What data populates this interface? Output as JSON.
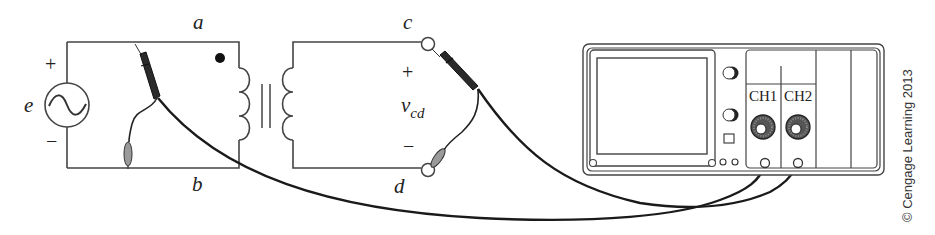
{
  "diagram": {
    "source": {
      "label": "e",
      "plus": "+",
      "minus": "−",
      "symbol": "ac-sine"
    },
    "primary": {
      "top_label": "a",
      "bottom_label": "b",
      "dot_marker": true
    },
    "secondary": {
      "top_terminal": "c",
      "bottom_terminal": "d",
      "voltage_label": "v",
      "voltage_subscript": "cd",
      "plus": "+",
      "minus": "−"
    },
    "oscilloscope": {
      "channels": [
        {
          "label": "CH1"
        },
        {
          "label": "CH2"
        }
      ]
    },
    "copyright": "© Cengage Learning 2013"
  },
  "colors": {
    "line": "#444444",
    "cable": "#1a1a1a",
    "probe_tip": "#2a2a2a",
    "ground_clip": "#9a9a9a",
    "knob": "#555555"
  }
}
